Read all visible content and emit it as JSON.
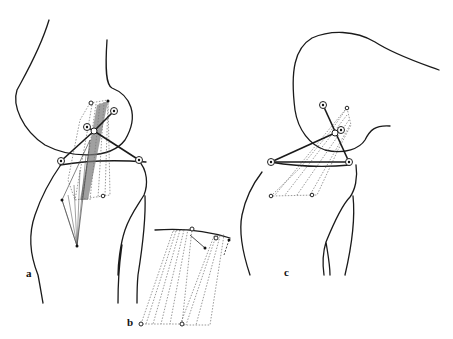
{
  "figure": {
    "panels": [
      {
        "id": "a",
        "label": "a",
        "description": "Knee joint side view with four-bar linkage and ligament fiber bundles in extended position"
      },
      {
        "id": "b",
        "label": "b",
        "description": "Enlarged detail of ligament fiber bundles with arc indicating rotation"
      },
      {
        "id": "c",
        "label": "c",
        "description": "Knee joint side view with four-bar linkage in flexed position"
      }
    ],
    "colors": {
      "line": "#1a1a1a",
      "background": "#ffffff",
      "hatch": "#555555"
    }
  }
}
